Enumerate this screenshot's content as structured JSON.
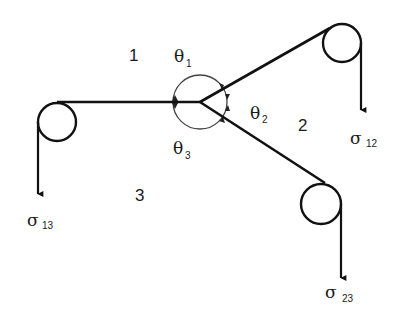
{
  "diagram": {
    "colors": {
      "line": "#111111",
      "background": "#ffffff",
      "angle_arc": "#444444"
    },
    "junction": {
      "x": 200,
      "y": 102
    },
    "regions": [
      {
        "id": "1",
        "label": "1"
      },
      {
        "id": "2",
        "label": "2"
      },
      {
        "id": "3",
        "label": "3"
      }
    ],
    "angles": [
      {
        "symbol": "θ",
        "subscript": "1"
      },
      {
        "symbol": "θ",
        "subscript": "2"
      },
      {
        "symbol": "θ",
        "subscript": "3"
      }
    ],
    "tensions": [
      {
        "symbol": "σ",
        "subscript": "12"
      },
      {
        "symbol": "σ",
        "subscript": "13"
      },
      {
        "symbol": "σ",
        "subscript": "23"
      }
    ]
  }
}
